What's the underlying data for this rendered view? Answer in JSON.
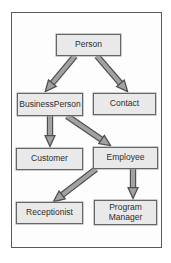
{
  "diagram": {
    "type": "class-hierarchy",
    "nodes": [
      {
        "id": "person",
        "label": "Person"
      },
      {
        "id": "businessperson",
        "label": "BusinessPerson"
      },
      {
        "id": "contact",
        "label": "Contact"
      },
      {
        "id": "customer",
        "label": "Customer"
      },
      {
        "id": "employee",
        "label": "Employee"
      },
      {
        "id": "receptionist",
        "label": "Receptionist"
      },
      {
        "id": "program-manager",
        "label": "Program Manager"
      }
    ],
    "edges": [
      {
        "from": "Person",
        "to": "BusinessPerson"
      },
      {
        "from": "Person",
        "to": "Contact"
      },
      {
        "from": "BusinessPerson",
        "to": "Customer"
      },
      {
        "from": "BusinessPerson",
        "to": "Employee"
      },
      {
        "from": "Employee",
        "to": "Receptionist"
      },
      {
        "from": "Employee",
        "to": "Program Manager"
      }
    ],
    "colors": {
      "box_fill": "#e9e9e9",
      "box_border": "#666666",
      "arrow_fill": "#a2a2a2",
      "arrow_outline": "#4f4f4f",
      "frame_border": "#5a5a5a",
      "text": "#2d2d2d"
    }
  }
}
